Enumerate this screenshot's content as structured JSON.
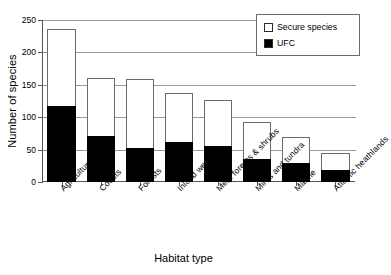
{
  "chart_data": {
    "type": "bar",
    "subtype": "stacked",
    "title": "",
    "xlabel": "Habitat type",
    "ylabel": "Number of species",
    "ylim": [
      0,
      250
    ],
    "yticks": [
      0,
      50,
      100,
      150,
      200,
      250
    ],
    "grid": true,
    "legend_position": "top-right",
    "categories": [
      "Agriculture",
      "Coasts",
      "Forests",
      "Inland wetlands",
      "Med. forests & shrubs",
      "Mires and tundra",
      "Marine",
      "Atlantic heathlands"
    ],
    "series": [
      {
        "name": "UFC",
        "color": "#000000",
        "values": [
          117,
          71,
          52,
          62,
          55,
          35,
          29,
          18
        ]
      },
      {
        "name": "Secure species",
        "color": "#ffffff",
        "values": [
          119,
          90,
          107,
          75,
          71,
          58,
          41,
          27
        ]
      }
    ],
    "totals": [
      236,
      161,
      159,
      137,
      126,
      93,
      70,
      45
    ]
  },
  "legend": {
    "items": [
      {
        "label": "Secure species",
        "swatch": "open-square"
      },
      {
        "label": "UFC",
        "swatch": "filled-square"
      }
    ]
  },
  "axes": {
    "y_title": "Number of species",
    "x_title": "Habitat type",
    "y_tick_labels": [
      "0",
      "50",
      "100",
      "150",
      "200",
      "250"
    ]
  }
}
